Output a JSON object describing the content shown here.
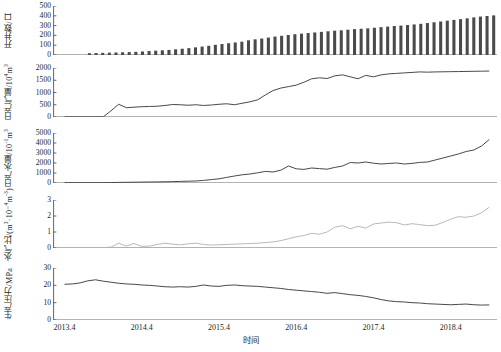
{
  "figure": {
    "x_axis_title": "时间",
    "x_tick_labels": [
      "2013.4",
      "2014.4",
      "2015.4",
      "2016.4",
      "2017.4",
      "2018.4"
    ],
    "x_range": [
      2013.25,
      2019.0
    ],
    "line_color": "#3f3f3f",
    "bar_color": "#4a4a4a",
    "ratio_color": "#b4b4b4",
    "axis_color": "#555555"
  },
  "chart_data": [
    {
      "type": "bar",
      "panel_index": 0,
      "title": "",
      "ylabel": "开井数/口",
      "ylabel_plain": "开井数/口",
      "xlabel": "",
      "ylim": [
        0,
        500
      ],
      "yticks": [
        0,
        100,
        200,
        300,
        400,
        500
      ],
      "grid": false,
      "legend": "none",
      "categories": [
        "2013.4",
        "2013.5",
        "2013.6",
        "2013.7",
        "2013.8",
        "2013.9",
        "2013.10",
        "2013.11",
        "2013.12",
        "2014.1",
        "2014.2",
        "2014.3",
        "2014.4",
        "2014.5",
        "2014.6",
        "2014.7",
        "2014.8",
        "2014.9",
        "2014.10",
        "2014.11",
        "2014.12",
        "2015.1",
        "2015.2",
        "2015.3",
        "2015.4",
        "2015.5",
        "2015.6",
        "2015.7",
        "2015.8",
        "2015.9",
        "2015.10",
        "2015.11",
        "2015.12",
        "2016.1",
        "2016.2",
        "2016.3",
        "2016.4",
        "2016.5",
        "2016.6",
        "2016.7",
        "2016.8",
        "2016.9",
        "2016.10",
        "2016.11",
        "2016.12",
        "2017.1",
        "2017.2",
        "2017.3",
        "2017.4",
        "2017.5",
        "2017.6",
        "2017.7",
        "2017.8",
        "2017.9",
        "2017.10",
        "2017.11",
        "2017.12",
        "2018.1",
        "2018.2",
        "2018.3",
        "2018.4",
        "2018.5",
        "2018.6",
        "2018.7",
        "2018.8",
        "2018.9",
        "2018.10"
      ],
      "values": [
        0,
        0,
        0,
        0,
        0,
        18,
        20,
        22,
        24,
        26,
        28,
        30,
        32,
        36,
        40,
        44,
        48,
        52,
        58,
        64,
        70,
        78,
        86,
        94,
        104,
        112,
        120,
        128,
        136,
        150,
        160,
        168,
        178,
        188,
        196,
        204,
        212,
        218,
        224,
        230,
        236,
        242,
        248,
        252,
        258,
        264,
        268,
        272,
        278,
        284,
        290,
        296,
        300,
        306,
        312,
        318,
        326,
        334,
        342,
        350,
        358,
        366,
        374,
        384,
        392,
        398,
        404
      ]
    },
    {
      "type": "line",
      "panel_index": 1,
      "title": "",
      "ylabel": "日产气量/10⁴m³",
      "ylabel_plain": "日产气量/10^4 m^3",
      "xlabel": "",
      "ylim": [
        0,
        2000
      ],
      "yticks": [
        0,
        500,
        1000,
        1500,
        2000
      ],
      "grid": false,
      "legend": "none",
      "x": [
        2013.4,
        2013.5,
        2013.6,
        2013.7,
        2013.8,
        2013.9,
        2014.0,
        2014.1,
        2014.2,
        2014.3,
        2014.4,
        2014.5,
        2014.6,
        2014.7,
        2014.8,
        2014.9,
        2015.0,
        2015.1,
        2015.2,
        2015.3,
        2015.4,
        2015.5,
        2015.6,
        2015.7,
        2015.8,
        2015.9,
        2016.0,
        2016.1,
        2016.2,
        2016.3,
        2016.4,
        2016.5,
        2016.6,
        2016.7,
        2016.8,
        2016.9,
        2017.0,
        2017.1,
        2017.2,
        2017.3,
        2017.4,
        2017.5,
        2017.6,
        2017.7,
        2017.8,
        2017.9,
        2018.0,
        2018.1,
        2018.2,
        2018.3,
        2018.4,
        2018.5,
        2018.6,
        2018.7,
        2018.8,
        2018.9
      ],
      "values": [
        5,
        5,
        5,
        5,
        5,
        5,
        250,
        520,
        380,
        400,
        420,
        430,
        440,
        470,
        510,
        500,
        480,
        500,
        470,
        490,
        520,
        540,
        500,
        560,
        620,
        700,
        900,
        1080,
        1180,
        1240,
        1300,
        1420,
        1560,
        1600,
        1570,
        1680,
        1720,
        1640,
        1560,
        1700,
        1640,
        1720,
        1760,
        1780,
        1800,
        1820,
        1840,
        1830,
        1840,
        1845,
        1850,
        1855,
        1860,
        1865,
        1870,
        1875
      ]
    },
    {
      "type": "line",
      "panel_index": 2,
      "title": "",
      "ylabel": "日产水量/10⁻¹m³",
      "ylabel_plain": "日产水量/10^-1 m^3",
      "xlabel": "",
      "ylim": [
        0,
        5000
      ],
      "yticks": [
        0,
        1000,
        2000,
        3000,
        4000,
        5000
      ],
      "grid": false,
      "legend": "none",
      "x": [
        2013.4,
        2013.5,
        2013.6,
        2013.7,
        2013.8,
        2013.9,
        2014.0,
        2014.1,
        2014.2,
        2014.3,
        2014.4,
        2014.5,
        2014.6,
        2014.7,
        2014.8,
        2014.9,
        2015.0,
        2015.1,
        2015.2,
        2015.3,
        2015.4,
        2015.5,
        2015.6,
        2015.7,
        2015.8,
        2015.9,
        2016.0,
        2016.1,
        2016.2,
        2016.3,
        2016.4,
        2016.5,
        2016.6,
        2016.7,
        2016.8,
        2016.9,
        2017.0,
        2017.1,
        2017.2,
        2017.3,
        2017.4,
        2017.5,
        2017.6,
        2017.7,
        2017.8,
        2017.9,
        2018.0,
        2018.1,
        2018.2,
        2018.3,
        2018.4,
        2018.5,
        2018.6,
        2018.7,
        2018.8,
        2018.9
      ],
      "values": [
        30,
        30,
        30,
        30,
        30,
        30,
        40,
        60,
        70,
        80,
        90,
        100,
        110,
        120,
        140,
        160,
        180,
        200,
        260,
        340,
        420,
        560,
        700,
        820,
        900,
        1020,
        1160,
        1100,
        1280,
        1700,
        1420,
        1360,
        1500,
        1440,
        1380,
        1560,
        1700,
        2050,
        2000,
        2100,
        1980,
        1900,
        1960,
        2000,
        1900,
        1960,
        2060,
        2100,
        2300,
        2500,
        2700,
        2900,
        3150,
        3300,
        3700,
        4350
      ]
    },
    {
      "type": "line",
      "panel_index": 3,
      "title": "",
      "ylabel": "水气比/(m³·10⁻⁴m⁻³)",
      "ylabel_plain": "水气比 m^3/10^4 m^3",
      "xlabel": "",
      "ylim": [
        0,
        3
      ],
      "yticks": [
        0,
        1,
        2,
        3
      ],
      "grid": false,
      "legend": "none",
      "x": [
        2013.4,
        2013.5,
        2013.6,
        2013.7,
        2013.8,
        2013.9,
        2014.0,
        2014.1,
        2014.2,
        2014.3,
        2014.4,
        2014.5,
        2014.6,
        2014.7,
        2014.8,
        2014.9,
        2015.0,
        2015.1,
        2015.2,
        2015.3,
        2015.4,
        2015.5,
        2015.6,
        2015.7,
        2015.8,
        2015.9,
        2016.0,
        2016.1,
        2016.2,
        2016.3,
        2016.4,
        2016.5,
        2016.6,
        2016.7,
        2016.8,
        2016.9,
        2017.0,
        2017.1,
        2017.2,
        2017.3,
        2017.4,
        2017.5,
        2017.6,
        2017.7,
        2017.8,
        2017.9,
        2018.0,
        2018.1,
        2018.2,
        2018.3,
        2018.4,
        2018.5,
        2018.6,
        2018.7,
        2018.8,
        2018.9
      ],
      "values": [
        0.02,
        0.02,
        0.02,
        0.02,
        0.03,
        0.03,
        0.05,
        0.3,
        0.12,
        0.28,
        0.1,
        0.12,
        0.22,
        0.3,
        0.24,
        0.2,
        0.26,
        0.3,
        0.22,
        0.18,
        0.2,
        0.22,
        0.24,
        0.26,
        0.28,
        0.3,
        0.34,
        0.38,
        0.46,
        0.58,
        0.7,
        0.78,
        0.92,
        0.86,
        1.0,
        1.3,
        1.4,
        1.2,
        1.36,
        1.24,
        1.5,
        1.56,
        1.62,
        1.58,
        1.44,
        1.52,
        1.46,
        1.4,
        1.42,
        1.6,
        1.8,
        1.96,
        1.92,
        2.0,
        2.2,
        2.55
      ]
    },
    {
      "type": "line",
      "panel_index": 4,
      "title": "",
      "ylabel": "生产压力/MPa",
      "ylabel_plain": "生产压力/MPa",
      "xlabel": "时间",
      "ylim": [
        0,
        30
      ],
      "yticks": [
        0,
        10,
        20,
        30
      ],
      "grid": false,
      "legend": "none",
      "x": [
        2013.4,
        2013.5,
        2013.6,
        2013.7,
        2013.8,
        2013.9,
        2014.0,
        2014.1,
        2014.2,
        2014.3,
        2014.4,
        2014.5,
        2014.6,
        2014.7,
        2014.8,
        2014.9,
        2015.0,
        2015.1,
        2015.2,
        2015.3,
        2015.4,
        2015.5,
        2015.6,
        2015.7,
        2015.8,
        2015.9,
        2016.0,
        2016.1,
        2016.2,
        2016.3,
        2016.4,
        2016.5,
        2016.6,
        2016.7,
        2016.8,
        2016.9,
        2017.0,
        2017.1,
        2017.2,
        2017.3,
        2017.4,
        2017.5,
        2017.6,
        2017.7,
        2017.8,
        2017.9,
        2018.0,
        2018.1,
        2018.2,
        2018.3,
        2018.4,
        2018.5,
        2018.6,
        2018.7,
        2018.8,
        2018.9
      ],
      "values": [
        20.6,
        20.8,
        21.4,
        22.6,
        23.2,
        22.4,
        21.8,
        21.2,
        20.8,
        20.6,
        20.2,
        20.0,
        19.6,
        19.2,
        19.0,
        19.2,
        19.0,
        19.4,
        20.2,
        19.6,
        19.4,
        20.0,
        20.2,
        19.8,
        19.6,
        19.4,
        19.0,
        18.6,
        18.2,
        17.6,
        17.2,
        16.8,
        16.4,
        16.0,
        15.4,
        15.8,
        15.2,
        14.6,
        14.2,
        13.6,
        12.8,
        11.8,
        11.0,
        10.6,
        10.4,
        10.0,
        9.8,
        9.4,
        9.2,
        9.0,
        8.8,
        9.0,
        9.2,
        8.8,
        8.6,
        8.7
      ]
    }
  ]
}
